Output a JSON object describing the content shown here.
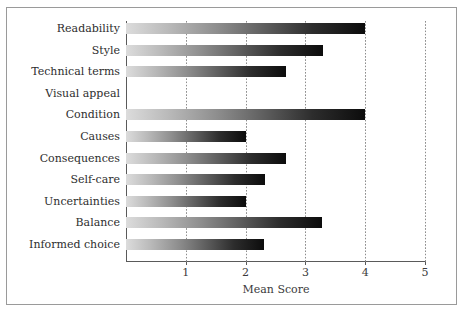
{
  "chart_data": {
    "type": "bar",
    "orientation": "horizontal",
    "title": "",
    "xlabel": "Mean Score",
    "ylabel": "",
    "xlim": [
      0,
      5
    ],
    "xticks": [
      "1",
      "2",
      "3",
      "4",
      "5"
    ],
    "xtick_values": [
      1,
      2,
      3,
      4,
      5
    ],
    "grid": "vertical dotted gridlines at each integer tick",
    "legend": "none",
    "categories": [
      "Readability",
      "Style",
      "Technical terms",
      "Visual appeal",
      "Condition",
      "Causes",
      "Consequences",
      "Self-care",
      "Uncertainties",
      "Balance",
      "Informed choice"
    ],
    "values": [
      4.0,
      3.3,
      2.67,
      0,
      4.0,
      2.0,
      2.67,
      2.32,
      2.0,
      3.27,
      2.3
    ],
    "bar_style": {
      "fill": "horizontal gradient light-gray to black",
      "gradient_start": "#dcdcdc",
      "gradient_end": "#0c0c0c"
    },
    "colors": {
      "axis": "#5a5a5a",
      "gridline": "#8d8d8d",
      "text": "#2e2e2e",
      "frame": "#9a9a9a",
      "background": "#ffffff"
    }
  }
}
